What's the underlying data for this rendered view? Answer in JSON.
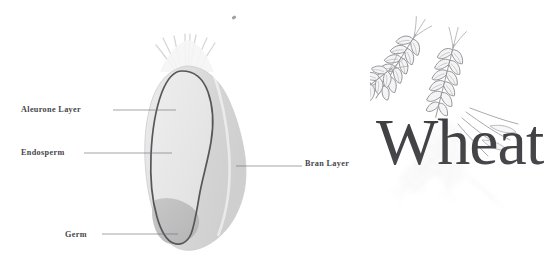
{
  "figure": {
    "background_color": "#ffffff",
    "labels": {
      "aleurone": "Aleurone Layer",
      "endosperm": "Endosperm",
      "germ": "Germ",
      "bran": "Bran Layer"
    },
    "label_color": "#46464a",
    "leader_line_color": "#6f6f74"
  },
  "kernel": {
    "name": "wheat-kernel-cross-section",
    "parts": [
      {
        "key": "brush",
        "label": "brush-hairs",
        "fill": "#f3f3f3",
        "stroke": "#d8d8d8"
      },
      {
        "key": "bran",
        "label": "Bran Layer",
        "fill": "#d9d9d9",
        "stroke": "#c4c4c4"
      },
      {
        "key": "aleurone",
        "label": "Aleurone Layer",
        "fill": "none",
        "stroke": "#5c5c60"
      },
      {
        "key": "endosperm",
        "label": "Endosperm",
        "fill": "#e6e6e6",
        "stroke": "#5c5c60"
      },
      {
        "key": "germ",
        "label": "Germ",
        "fill": "#bcbcbc",
        "stroke": "#bcbcbc"
      }
    ]
  },
  "logo": {
    "wordmark": "Wheat",
    "wordmark_color": "#3b3b3f",
    "illustration": "wheat-stalks-engraving",
    "illustration_color": "#9a9a9e",
    "reflection": "wheat-stalks-reflection"
  },
  "artifacts": {
    "speck": "scan-speck"
  }
}
